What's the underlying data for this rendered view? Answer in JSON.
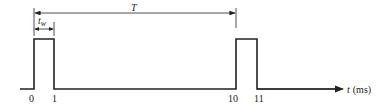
{
  "diagram": {
    "period_label": "T",
    "width_label_base": "t",
    "width_label_sub": "w",
    "axis_label_var": "t",
    "axis_label_unit": "(ms)",
    "ticks": [
      "0",
      "1",
      "10",
      "11"
    ],
    "colors": {
      "line": "#222222",
      "background": "#ffffff"
    }
  }
}
